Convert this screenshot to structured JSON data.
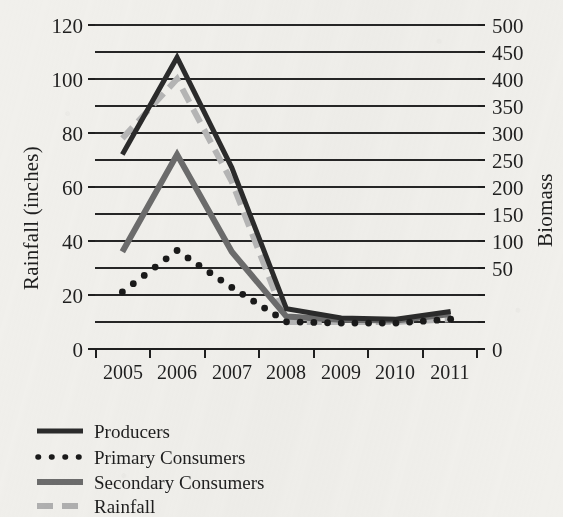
{
  "chart_data": {
    "type": "line",
    "title": "",
    "xlabel": "",
    "categories": [
      "2005",
      "2006",
      "2007",
      "2008",
      "2009",
      "2010",
      "2011"
    ],
    "grid": true,
    "legend_position": "bottom-left",
    "left_axis": {
      "label": "Rainfall (inches)",
      "ylim": [
        0,
        120
      ],
      "tick_labels": [
        "0",
        "20",
        "40",
        "60",
        "80",
        "100",
        "120"
      ],
      "tick_values": [
        0,
        20,
        40,
        60,
        80,
        100,
        120
      ],
      "gridline_step": 10
    },
    "right_axis": {
      "label": "Biomass",
      "ylim": [
        0,
        500
      ],
      "tick_labels": [
        "0",
        "50",
        "100",
        "150",
        "200",
        "250",
        "300",
        "350",
        "400",
        "450",
        "500"
      ],
      "tick_values": [
        0,
        50,
        100,
        150,
        200,
        250,
        300,
        350,
        400,
        450,
        500
      ]
    },
    "series": [
      {
        "name": "Producers",
        "axis": "right",
        "style": "solid",
        "color": "#2b2b2b",
        "values": [
          300,
          450,
          280,
          62,
          48,
          46,
          58
        ],
        "left_scale_values": [
          72,
          108,
          67,
          15,
          11.5,
          11,
          14
        ]
      },
      {
        "name": "Primary Consumers",
        "axis": "right",
        "style": "dotted",
        "color": "#1a1a1a",
        "values": [
          88,
          152,
          95,
          42,
          40,
          40,
          46
        ],
        "left_scale_values": [
          21,
          36.5,
          23,
          10,
          9.5,
          9.5,
          11
        ]
      },
      {
        "name": "Secondary Consumers",
        "axis": "right",
        "style": "solid",
        "color": "#6c6c6c",
        "values": [
          150,
          300,
          150,
          50,
          45,
          44,
          54
        ],
        "left_scale_values": [
          36,
          72,
          36,
          12,
          10.8,
          10.5,
          13
        ]
      },
      {
        "name": "Rainfall",
        "axis": "left",
        "style": "dashed",
        "color": "#b6b6b6",
        "values": [
          78,
          100,
          62,
          10,
          10,
          10,
          11
        ],
        "left_scale_values": [
          78,
          100,
          62,
          10,
          10,
          10,
          11
        ]
      }
    ]
  },
  "legend": {
    "items": [
      {
        "label": "Producers",
        "swatch": "solid-dark"
      },
      {
        "label": "Primary Consumers",
        "swatch": "dotted-black"
      },
      {
        "label": "Secondary Consumers",
        "swatch": "solid-gray"
      },
      {
        "label": "Rainfall",
        "swatch": "dashed-lightgray"
      }
    ]
  },
  "colors": {
    "producers": "#2b2b2b",
    "primary_consumers": "#1a1a1a",
    "secondary_consumers": "#6c6c6c",
    "rainfall": "#b6b6b6",
    "axis": "#1f1f1f",
    "background": "#f1f0ec"
  }
}
